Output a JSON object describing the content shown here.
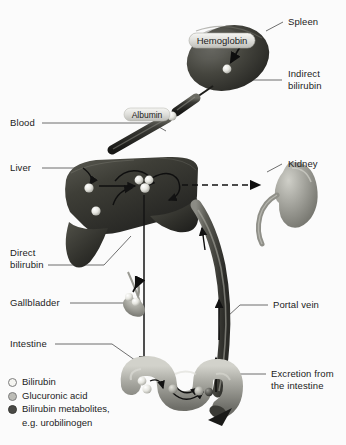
{
  "figure": {
    "background_color": "#fbfbfb",
    "label_color": "#1b1b1b"
  },
  "labels": {
    "spleen": "Spleen",
    "indirect_bilirubin_line1": "Indirect",
    "indirect_bilirubin_line2": "bilirubin",
    "blood": "Blood",
    "liver": "Liver",
    "kidney": "Kidney",
    "direct_bilirubin_line1": "Direct",
    "direct_bilirubin_line2": "bilirubin",
    "gallbladder": "Gallbladder",
    "portal_vein": "Portal vein",
    "intestine": "Intestine",
    "excretion_line1": "Excretion from",
    "excretion_line2": "the intestine"
  },
  "inline_tags": {
    "hemoglobin": "Hemoglobin",
    "albumin": "Albumin"
  },
  "legend": {
    "items": [
      {
        "label": "Bilirubin",
        "color": "#f2f2ee",
        "marker": "open-circle"
      },
      {
        "label": "Glucuronic acid",
        "color": "#b8b8b2",
        "marker": "gray-circle"
      },
      {
        "label": "Bilirubin metabolites,",
        "label2": "e.g. urobilinogen",
        "color": "#4a4a46",
        "marker": "dark-circle"
      }
    ]
  },
  "organs": {
    "spleen": {
      "name": "spleen",
      "fill": "#3b3b38"
    },
    "liver": {
      "name": "liver",
      "fill": "#35352f"
    },
    "kidney": {
      "name": "kidney",
      "fill": "#8d8d86"
    },
    "gallbladder": {
      "name": "gallbladder",
      "fill": "#8e8e88"
    },
    "intestine": {
      "name": "intestine",
      "fill": "#9b9b94"
    },
    "blood_vessel": {
      "name": "blood-vessel",
      "fill": "#3a3a36"
    },
    "portal_vein": {
      "name": "portal-vein",
      "fill": "#56564f"
    }
  }
}
